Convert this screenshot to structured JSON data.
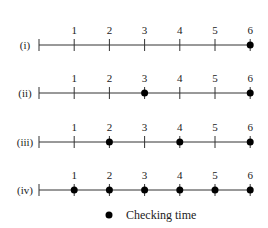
{
  "chart_data": {
    "type": "scatter",
    "title": "",
    "xlabel": "",
    "ylabel": "",
    "x_ticks": [
      1,
      2,
      3,
      4,
      5,
      6
    ],
    "series": [
      {
        "name": "(i)",
        "checking_times": [
          6
        ]
      },
      {
        "name": "(ii)",
        "checking_times": [
          3,
          6
        ]
      },
      {
        "name": "(iii)",
        "checking_times": [
          2,
          4,
          6
        ]
      },
      {
        "name": "(iv)",
        "checking_times": [
          1,
          2,
          3,
          4,
          5,
          6
        ]
      }
    ],
    "legend": [
      {
        "marker": "filled-circle",
        "label": "Checking time"
      }
    ]
  },
  "rows": [
    {
      "label": "(i)"
    },
    {
      "label": "(ii)"
    },
    {
      "label": "(iii)"
    },
    {
      "label": "(iv)"
    }
  ],
  "tick_labels": [
    "1",
    "2",
    "3",
    "4",
    "5",
    "6"
  ],
  "legend": {
    "label": "Checking time"
  },
  "colors": {
    "line": "#333333",
    "dot": "#000000"
  }
}
